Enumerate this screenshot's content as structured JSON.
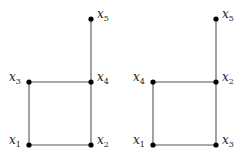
{
  "graphs": [
    {
      "id": "left",
      "nodes": [
        {
          "name": "x",
          "sub": "1",
          "x": 29,
          "y": 145,
          "label_side": "left"
        },
        {
          "name": "x",
          "sub": "2",
          "x": 91,
          "y": 145,
          "label_side": "right"
        },
        {
          "name": "x",
          "sub": "3",
          "x": 29,
          "y": 82,
          "label_side": "left"
        },
        {
          "name": "x",
          "sub": "4",
          "x": 91,
          "y": 82,
          "label_side": "right"
        },
        {
          "name": "x",
          "sub": "5",
          "x": 91,
          "y": 19,
          "label_side": "right"
        }
      ],
      "edges": [
        [
          "x1",
          "x2"
        ],
        [
          "x1",
          "x3"
        ],
        [
          "x3",
          "x4"
        ],
        [
          "x2",
          "x4"
        ],
        [
          "x4",
          "x5"
        ]
      ]
    },
    {
      "id": "right",
      "nodes": [
        {
          "name": "x",
          "sub": "1",
          "x": 153,
          "y": 145,
          "label_side": "left"
        },
        {
          "name": "x",
          "sub": "3",
          "x": 216,
          "y": 145,
          "label_side": "right"
        },
        {
          "name": "x",
          "sub": "4",
          "x": 153,
          "y": 82,
          "label_side": "left"
        },
        {
          "name": "x",
          "sub": "2",
          "x": 216,
          "y": 82,
          "label_side": "right"
        },
        {
          "name": "x",
          "sub": "5",
          "x": 216,
          "y": 19,
          "label_side": "right"
        }
      ],
      "edges": [
        [
          "x1",
          "x3"
        ],
        [
          "x1",
          "x4"
        ],
        [
          "x4",
          "x2"
        ],
        [
          "x3",
          "x2"
        ],
        [
          "x2",
          "x5"
        ]
      ]
    }
  ]
}
